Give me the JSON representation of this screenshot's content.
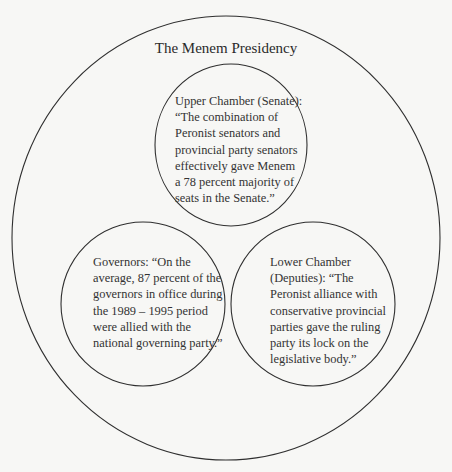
{
  "diagram": {
    "title": "The Menem Presidency",
    "colors": {
      "background": "#f7f7f5",
      "stroke": "#2f2f2f",
      "text": "#333333"
    },
    "circles": [
      {
        "id": "upper",
        "lines": [
          "Upper Chamber (Senate):",
          "“The combination of",
          "Peronist senators and",
          "provincial party senators",
          "effectively gave Menem",
          "a 78 percent majority of",
          "seats in the Senate.”"
        ]
      },
      {
        "id": "governors",
        "lines": [
          "Governors: “On the",
          "average, 87 percent of the",
          "governors in office during",
          "the 1989 – 1995 period",
          "were allied with the",
          "national governing party.”"
        ]
      },
      {
        "id": "lower",
        "lines": [
          "Lower Chamber",
          "(Deputies): “The",
          "Peronist alliance with",
          "conservative provincial",
          "parties gave the ruling",
          "party its lock on the",
          "legislative body.”"
        ]
      }
    ]
  }
}
